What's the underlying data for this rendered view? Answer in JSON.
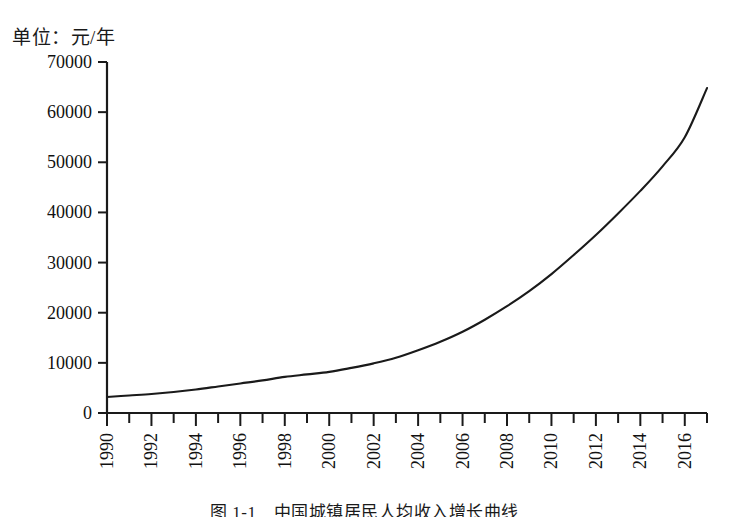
{
  "unit_label": "单位：元/年",
  "caption": "图 1-1　中国城镇居民人均收入增长曲线",
  "chart_data": {
    "type": "line",
    "title": "",
    "subtitle": "",
    "xlabel": "",
    "ylabel": "单位：元/年",
    "grid": false,
    "legend": "none",
    "xlim": [
      1990,
      2017
    ],
    "ylim": [
      0,
      70000
    ],
    "ytick_labels": [
      "0",
      "10000",
      "20000",
      "30000",
      "40000",
      "50000",
      "60000",
      "70000"
    ],
    "ytick_values": [
      0,
      10000,
      20000,
      30000,
      40000,
      50000,
      60000,
      70000
    ],
    "xtick_labels": [
      "1990",
      "1992",
      "1994",
      "1996",
      "1998",
      "2000",
      "2002",
      "2004",
      "2006",
      "2008",
      "2010",
      "2012",
      "2014",
      "2016"
    ],
    "xtick_values": [
      1990,
      1992,
      1994,
      1996,
      1998,
      2000,
      2002,
      2004,
      2006,
      2008,
      2010,
      2012,
      2014,
      2016
    ],
    "x": [
      1990,
      1991,
      1992,
      1993,
      1994,
      1995,
      1996,
      1997,
      1998,
      1999,
      2000,
      2001,
      2002,
      2003,
      2004,
      2005,
      2006,
      2007,
      2008,
      2009,
      2010,
      2011,
      2012,
      2013,
      2014,
      2015,
      2016,
      2017
    ],
    "series": [
      {
        "name": "城镇居民人均收入",
        "values": [
          3200,
          3500,
          3800,
          4200,
          4700,
          5300,
          5900,
          6500,
          7200,
          7700,
          8200,
          9000,
          9900,
          11000,
          12500,
          14200,
          16200,
          18600,
          21300,
          24300,
          27700,
          31500,
          35500,
          39800,
          44300,
          49200,
          55000,
          64800
        ]
      }
    ]
  }
}
